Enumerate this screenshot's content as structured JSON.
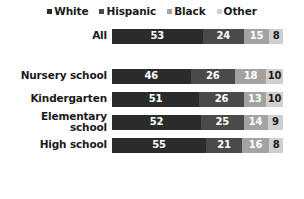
{
  "chart_data": {
    "type": "bar",
    "subtype": "stacked-horizontal-100",
    "title": "",
    "xlabel": "",
    "ylabel": "",
    "grid": false,
    "legend_position": "top-center",
    "xlim": [
      0,
      100
    ],
    "categories": [
      "All",
      "Nursery school",
      "Kindergarten",
      "Elementary school",
      "High school"
    ],
    "series": [
      {
        "name": "White",
        "color": "#2b2b2b",
        "values": [
          53,
          46,
          51,
          52,
          55
        ]
      },
      {
        "name": "Hispanic",
        "color": "#4a4a4a",
        "values": [
          24,
          26,
          26,
          25,
          21
        ]
      },
      {
        "name": "Black",
        "color": "#a3a3a3",
        "values": [
          15,
          18,
          13,
          14,
          16
        ]
      },
      {
        "name": "Other",
        "color": "#cfcfcf",
        "values": [
          8,
          10,
          10,
          9,
          8
        ]
      }
    ]
  },
  "legend": {
    "items": [
      {
        "label": "White",
        "color": "#2b2b2b"
      },
      {
        "label": "Hispanic",
        "color": "#4a4a4a"
      },
      {
        "label": "Black",
        "color": "#a3a3a3"
      },
      {
        "label": "Other",
        "color": "#cfcfcf"
      }
    ]
  },
  "rows": [
    {
      "label_line1": "All",
      "label_line2": "",
      "group": "overall",
      "segments": [
        {
          "series": "White",
          "value": 53,
          "color": "#2b2b2b",
          "text_color": "light"
        },
        {
          "series": "Hispanic",
          "value": 24,
          "color": "#4a4a4a",
          "text_color": "light"
        },
        {
          "series": "Black",
          "value": 15,
          "color": "#a3a3a3",
          "text_color": "light"
        },
        {
          "series": "Other",
          "value": 8,
          "color": "#cfcfcf",
          "text_color": "dark"
        }
      ]
    },
    {
      "label_line1": "Nursery school",
      "label_line2": "",
      "group": "by-level",
      "segments": [
        {
          "series": "White",
          "value": 46,
          "color": "#2b2b2b",
          "text_color": "light"
        },
        {
          "series": "Hispanic",
          "value": 26,
          "color": "#4a4a4a",
          "text_color": "light"
        },
        {
          "series": "Black",
          "value": 18,
          "color": "#a3a3a3",
          "text_color": "light"
        },
        {
          "series": "Other",
          "value": 10,
          "color": "#cfcfcf",
          "text_color": "dark"
        }
      ]
    },
    {
      "label_line1": "Kindergarten",
      "label_line2": "",
      "group": "by-level",
      "segments": [
        {
          "series": "White",
          "value": 51,
          "color": "#2b2b2b",
          "text_color": "light"
        },
        {
          "series": "Hispanic",
          "value": 26,
          "color": "#4a4a4a",
          "text_color": "light"
        },
        {
          "series": "Black",
          "value": 13,
          "color": "#a3a3a3",
          "text_color": "light"
        },
        {
          "series": "Other",
          "value": 10,
          "color": "#cfcfcf",
          "text_color": "dark"
        }
      ]
    },
    {
      "label_line1": "Elementary",
      "label_line2": "school",
      "group": "by-level",
      "segments": [
        {
          "series": "White",
          "value": 52,
          "color": "#2b2b2b",
          "text_color": "light"
        },
        {
          "series": "Hispanic",
          "value": 25,
          "color": "#4a4a4a",
          "text_color": "light"
        },
        {
          "series": "Black",
          "value": 14,
          "color": "#a3a3a3",
          "text_color": "light"
        },
        {
          "series": "Other",
          "value": 9,
          "color": "#cfcfcf",
          "text_color": "dark"
        }
      ]
    },
    {
      "label_line1": "High school",
      "label_line2": "",
      "group": "by-level",
      "segments": [
        {
          "series": "White",
          "value": 55,
          "color": "#2b2b2b",
          "text_color": "light"
        },
        {
          "series": "Hispanic",
          "value": 21,
          "color": "#4a4a4a",
          "text_color": "light"
        },
        {
          "series": "Black",
          "value": 16,
          "color": "#a3a3a3",
          "text_color": "light"
        },
        {
          "series": "Other",
          "value": 8,
          "color": "#cfcfcf",
          "text_color": "dark"
        }
      ]
    }
  ]
}
